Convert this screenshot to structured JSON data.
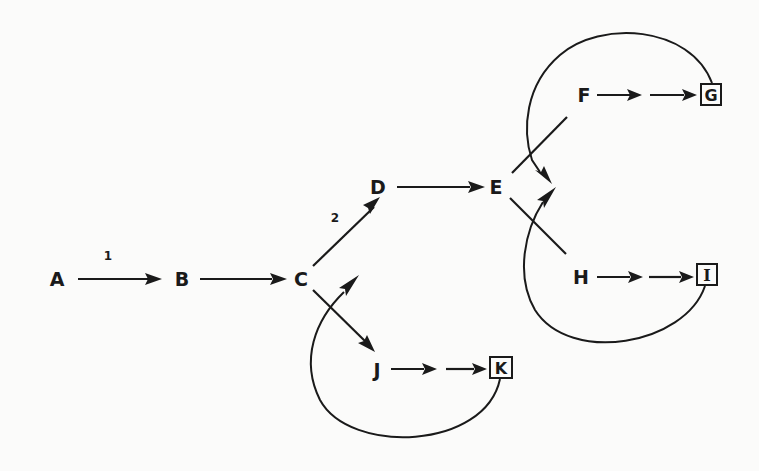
{
  "diagram": {
    "type": "directed-graph",
    "background": "#fbfbfa",
    "ink": "#1a1a1a",
    "nodes": {
      "A": {
        "label": "A",
        "terminal": false
      },
      "B": {
        "label": "B",
        "terminal": false
      },
      "C": {
        "label": "C",
        "terminal": false
      },
      "D": {
        "label": "D",
        "terminal": false
      },
      "E": {
        "label": "E",
        "terminal": false
      },
      "F": {
        "label": "F",
        "terminal": false
      },
      "G": {
        "label": "G",
        "terminal": true
      },
      "H": {
        "label": "H",
        "terminal": false
      },
      "I": {
        "label": "I",
        "terminal": true
      },
      "J": {
        "label": "J",
        "terminal": false
      },
      "K": {
        "label": "K",
        "terminal": true
      }
    },
    "edge_labels": {
      "a_to_b": "1",
      "c_to_d": "2"
    },
    "edges": [
      {
        "from": "A",
        "to": "B",
        "label": "1",
        "style": "solid-arrow"
      },
      {
        "from": "B",
        "to": "C",
        "style": "solid-arrow"
      },
      {
        "from": "C",
        "to": "D",
        "label": "2",
        "style": "solid-arrow"
      },
      {
        "from": "C",
        "to": "J",
        "style": "solid-arrow"
      },
      {
        "from": "D",
        "to": "E",
        "style": "solid-arrow"
      },
      {
        "from": "E",
        "to": "F",
        "style": "line"
      },
      {
        "from": "E",
        "to": "H",
        "style": "line"
      },
      {
        "from": "F",
        "to": "G",
        "style": "double-arrow-chain"
      },
      {
        "from": "H",
        "to": "I",
        "style": "double-arrow-chain"
      },
      {
        "from": "J",
        "to": "K",
        "style": "double-arrow-chain"
      },
      {
        "from": "G",
        "to": "E",
        "style": "curved-feedback-arrow"
      },
      {
        "from": "I",
        "to": "E",
        "style": "curved-feedback-arrow"
      },
      {
        "from": "K",
        "to": "C",
        "style": "curved-feedback-arrow"
      }
    ]
  }
}
